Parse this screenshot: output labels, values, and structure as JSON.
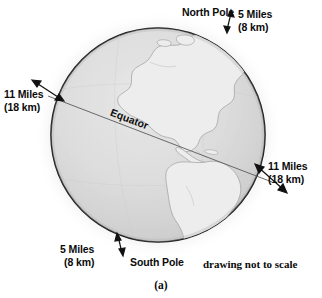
{
  "figure": {
    "caption": "(a)",
    "note": "drawing not to scale"
  },
  "colors": {
    "ocean": "#d6d6d6",
    "land": "#ececec",
    "outline": "#1a1a1a",
    "coastline": "#9a9a9a",
    "equator_line": "#555555",
    "text": "#0b0b0b",
    "background": "#ffffff",
    "shadow": "#bdbdbd"
  },
  "globe": {
    "equator_label": "Equator",
    "north_pole_label": "North Pole",
    "south_pole_label": "South Pole",
    "center_x": 158,
    "center_y": 135,
    "radius": 108,
    "equator_tilt_degrees": 21
  },
  "callouts": [
    {
      "id": "north-pole-bulge",
      "line1": "5 Miles",
      "line2": "(8 km)",
      "miles": 5,
      "km": 8,
      "position": "top-right"
    },
    {
      "id": "equator-bulge-left",
      "line1": "11 Miles",
      "line2": "(18 km)",
      "miles": 11,
      "km": 18,
      "position": "left"
    },
    {
      "id": "equator-bulge-right",
      "line1": "11 Miles",
      "line2": "(18 km)",
      "miles": 11,
      "km": 18,
      "position": "right"
    },
    {
      "id": "south-pole-bulge",
      "line1": "5 Miles",
      "line2": "(8 km)",
      "miles": 5,
      "km": 8,
      "position": "bottom-left"
    }
  ]
}
